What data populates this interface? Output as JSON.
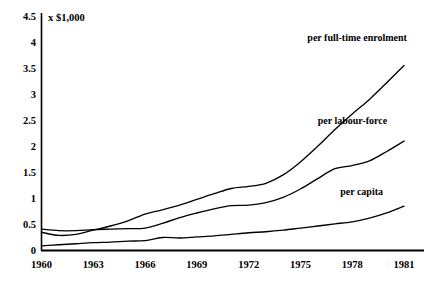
{
  "chart_data": {
    "type": "line",
    "title": "",
    "subtitle": "",
    "unit_label": "x $1,000",
    "xlabel": "",
    "ylabel": "",
    "xlim": [
      1960,
      1981
    ],
    "ylim": [
      0,
      4.5
    ],
    "grid": false,
    "legend_position": "inline-right-of-curve",
    "yticks": [
      "0",
      "0.5",
      "1",
      "1.5",
      "2",
      "2.5",
      "3",
      "3.5",
      "4",
      "4.5"
    ],
    "ytick_values": [
      0,
      0.5,
      1,
      1.5,
      2,
      2.5,
      3,
      3.5,
      4,
      4.5
    ],
    "xticks": [
      "1960",
      "1963",
      "1966",
      "1969",
      "1972",
      "1975",
      "1978",
      "1981"
    ],
    "xtick_values": [
      1960,
      1963,
      1966,
      1969,
      1972,
      1975,
      1978,
      1981
    ],
    "x": [
      1960,
      1961,
      1962,
      1963,
      1964,
      1965,
      1966,
      1967,
      1968,
      1969,
      1970,
      1971,
      1972,
      1973,
      1974,
      1975,
      1976,
      1977,
      1978,
      1979,
      1980,
      1981
    ],
    "series": [
      {
        "name": "per full-time enrolment",
        "label": "per full-time enrolment",
        "label_x": 1975.4,
        "label_y": 4.02,
        "values": [
          0.35,
          0.29,
          0.31,
          0.39,
          0.47,
          0.57,
          0.7,
          0.78,
          0.87,
          0.98,
          1.09,
          1.19,
          1.23,
          1.29,
          1.45,
          1.7,
          2.0,
          2.32,
          2.62,
          2.9,
          3.22,
          3.55
        ]
      },
      {
        "name": "per labour-force",
        "label": "per labour-force",
        "label_x": 1976.0,
        "label_y": 2.42,
        "values": [
          0.41,
          0.38,
          0.38,
          0.4,
          0.41,
          0.42,
          0.43,
          0.52,
          0.63,
          0.72,
          0.8,
          0.86,
          0.87,
          0.92,
          1.02,
          1.18,
          1.38,
          1.57,
          1.63,
          1.72,
          1.9,
          2.1
        ]
      },
      {
        "name": "per capita",
        "label": "per capita",
        "label_x": 1977.3,
        "label_y": 1.06,
        "values": [
          0.09,
          0.11,
          0.13,
          0.15,
          0.16,
          0.18,
          0.19,
          0.25,
          0.24,
          0.26,
          0.28,
          0.31,
          0.34,
          0.36,
          0.39,
          0.43,
          0.47,
          0.51,
          0.55,
          0.62,
          0.72,
          0.85
        ]
      }
    ]
  },
  "colors": {
    "axis": "#000000",
    "line": "#000000",
    "background": "#ffffff"
  }
}
